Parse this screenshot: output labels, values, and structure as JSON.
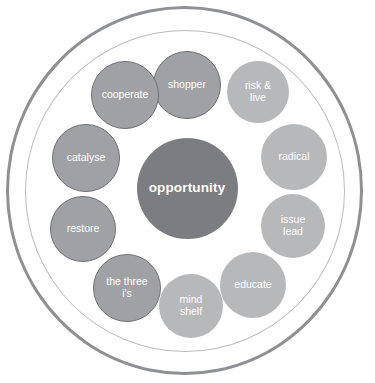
{
  "diagram": {
    "hub": {
      "label": "opportunity",
      "color": "#7b7d80",
      "text_color": "#ffffff",
      "cx": 187,
      "cy": 188,
      "d": 101
    },
    "rings": [
      {
        "name": "outer-ring",
        "stroke": "#8e9093",
        "stroke_width": 3
      },
      {
        "name": "inner-ring",
        "stroke": "#b9bbbd",
        "stroke_width": 1.5
      }
    ],
    "nodes": [
      {
        "id": "shopper",
        "label": "shopper",
        "style": "dark",
        "color": "#9fa1a4",
        "stroke": "#6f7174",
        "cx": 187,
        "cy": 85,
        "d": 68
      },
      {
        "id": "risk-live",
        "label": "risk &\nlive",
        "style": "light",
        "color": "#b6b8ba",
        "stroke": "none",
        "cx": 258,
        "cy": 92,
        "d": 62
      },
      {
        "id": "radical",
        "label": "radical",
        "style": "light",
        "color": "#b6b8ba",
        "stroke": "none",
        "cx": 294,
        "cy": 157,
        "d": 66
      },
      {
        "id": "issue-lead",
        "label": "issue\nlead",
        "style": "light",
        "color": "#b6b8ba",
        "stroke": "none",
        "cx": 293,
        "cy": 226,
        "d": 64
      },
      {
        "id": "educate",
        "label": "educate",
        "style": "light",
        "color": "#b6b8ba",
        "stroke": "none",
        "cx": 253,
        "cy": 285,
        "d": 66
      },
      {
        "id": "mind-shelf",
        "label": "mind\nshelf",
        "style": "light",
        "color": "#b6b8ba",
        "stroke": "none",
        "cx": 191,
        "cy": 306,
        "d": 64
      },
      {
        "id": "the-three-is",
        "label": "the three\ni's",
        "style": "dark",
        "color": "#9fa1a4",
        "stroke": "#6f7174",
        "cx": 127,
        "cy": 288,
        "d": 68
      },
      {
        "id": "restore",
        "label": "restore",
        "style": "dark",
        "color": "#9fa1a4",
        "stroke": "#6f7174",
        "cx": 83,
        "cy": 229,
        "d": 66
      },
      {
        "id": "catalyse",
        "label": "catalyse",
        "style": "dark",
        "color": "#9fa1a4",
        "stroke": "#6f7174",
        "cx": 86,
        "cy": 158,
        "d": 68
      },
      {
        "id": "cooperate",
        "label": "cooperate",
        "style": "dark",
        "color": "#9fa1a4",
        "stroke": "#6f7174",
        "cx": 125,
        "cy": 95,
        "d": 68
      }
    ]
  }
}
